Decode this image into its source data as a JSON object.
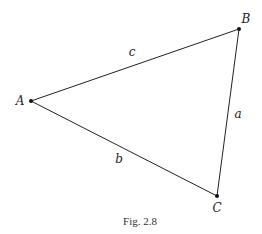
{
  "figure": {
    "caption": "Fig. 2.8",
    "stroke_color": "#222222",
    "background": "#ffffff"
  },
  "vertices": [
    {
      "name": "A",
      "label": "A",
      "x": 31,
      "y": 101,
      "label_x": 20,
      "label_y": 105
    },
    {
      "name": "B",
      "label": "B",
      "x": 239,
      "y": 29,
      "label_x": 245,
      "label_y": 23
    },
    {
      "name": "C",
      "label": "C",
      "x": 217,
      "y": 196,
      "label_x": 217,
      "label_y": 212
    }
  ],
  "sides": [
    {
      "name": "c",
      "label": "c",
      "from": "A",
      "to": "B",
      "label_x": 132,
      "label_y": 56
    },
    {
      "name": "a",
      "label": "a",
      "from": "B",
      "to": "C",
      "label_x": 238,
      "label_y": 118
    },
    {
      "name": "b",
      "label": "b",
      "from": "A",
      "to": "C",
      "label_x": 119,
      "label_y": 163
    }
  ]
}
